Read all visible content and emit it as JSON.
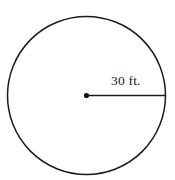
{
  "figure": {
    "type": "circle-with-radius",
    "background_color": "#ffffff",
    "stroke_color": "#1a1a1a",
    "canvas": {
      "width": 175,
      "height": 180
    },
    "circle": {
      "center_x": 86.5,
      "center_y": 95.5,
      "radius": 79,
      "stroke_width": 1.5,
      "fill": "none"
    },
    "center_point": {
      "label": "center-dot",
      "x": 86.5,
      "y": 95.5,
      "radius": 2.6,
      "color": "#111111"
    },
    "radius_segment": {
      "x1": 86.5,
      "y1": 95.5,
      "x2": 165.5,
      "y2": 95.5,
      "stroke_width": 1.6
    },
    "radius_label": {
      "text": "30 ft.",
      "value": 30,
      "unit": "ft.",
      "color": "#1a1a1a"
    }
  }
}
